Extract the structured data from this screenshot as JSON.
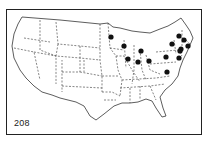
{
  "map": {
    "label": "208",
    "region": "Contiguous United States",
    "colors": {
      "outline": "#333333",
      "dot": "#111111",
      "background": "#ffffff"
    },
    "markers": [
      {
        "x": 111,
        "y": 37
      },
      {
        "x": 124,
        "y": 46
      },
      {
        "x": 141,
        "y": 51
      },
      {
        "x": 128,
        "y": 59
      },
      {
        "x": 138,
        "y": 62
      },
      {
        "x": 149,
        "y": 61
      },
      {
        "x": 179,
        "y": 36
      },
      {
        "x": 184,
        "y": 40
      },
      {
        "x": 172,
        "y": 44
      },
      {
        "x": 188,
        "y": 46
      },
      {
        "x": 181,
        "y": 49
      },
      {
        "x": 166,
        "y": 57
      },
      {
        "x": 179,
        "y": 58
      },
      {
        "x": 180,
        "y": 51
      },
      {
        "x": 167,
        "y": 72
      }
    ]
  }
}
